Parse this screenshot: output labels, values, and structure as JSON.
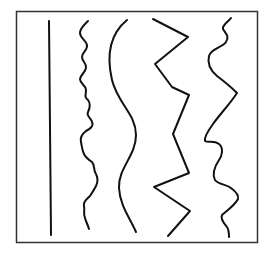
{
  "diagram": {
    "frame": {
      "x": 16,
      "y": 11,
      "width": 242,
      "height": 232,
      "color": "#333333"
    },
    "line_color": "#111111",
    "lines": [
      {
        "id": "straight",
        "kind": "straight"
      },
      {
        "id": "jagged-wiggly",
        "kind": "irregular-wavy"
      },
      {
        "id": "smooth-curve",
        "kind": "smooth-curve"
      },
      {
        "id": "zigzag",
        "kind": "angular-zigzag"
      },
      {
        "id": "mixed-curve",
        "kind": "curved-and-angular"
      }
    ]
  }
}
